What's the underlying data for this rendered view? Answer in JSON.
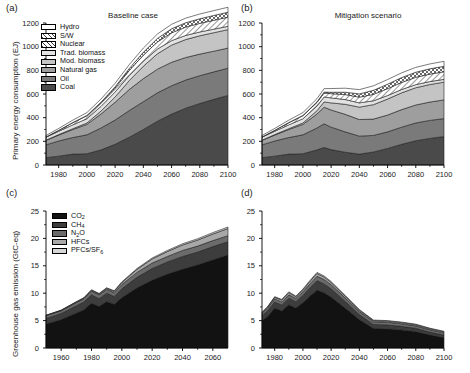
{
  "figure": {
    "panels": [
      {
        "tag": "(a)",
        "title": "Baseline case"
      },
      {
        "tag": "(b)",
        "title": "Mitigation scenario"
      },
      {
        "tag": "(c)",
        "title": ""
      },
      {
        "tag": "(d)",
        "title": ""
      }
    ]
  },
  "energy_legend": [
    {
      "label": "Hydro",
      "fill": "#ffffff",
      "pattern": "solid"
    },
    {
      "label": "S/W",
      "fill": "#ffffff",
      "pattern": "crosshatch"
    },
    {
      "label": "Nuclear",
      "fill": "#ffffff",
      "pattern": "diagonal"
    },
    {
      "label": "Trad. biomass",
      "fill": "#e2e2e2",
      "pattern": "solid"
    },
    {
      "label": "Mod. biomass",
      "fill": "#c4c4c4",
      "pattern": "solid"
    },
    {
      "label": "Natural gas",
      "fill": "#9e9e9e",
      "pattern": "solid"
    },
    {
      "label": "Oil",
      "fill": "#7a7a7a",
      "pattern": "solid"
    },
    {
      "label": "Coal",
      "fill": "#4a4a4a",
      "pattern": "solid"
    }
  ],
  "ghg_legend": [
    {
      "label": "CO2",
      "html": "CO<sub>2</sub>",
      "fill": "#121212",
      "pattern": "solid"
    },
    {
      "label": "CH4",
      "html": "CH<sub>4</sub>",
      "fill": "#3d3d3d",
      "pattern": "solid"
    },
    {
      "label": "N2O",
      "html": "N<sub>2</sub>O",
      "fill": "#6b6b6b",
      "pattern": "solid"
    },
    {
      "label": "HFCs",
      "html": "HFCs",
      "fill": "#a8a8a8",
      "pattern": "solid"
    },
    {
      "label": "PFCs/SF6",
      "html": "PFCs/SF<sub>6</sub>",
      "fill": "#d6d6d6",
      "pattern": "solid"
    }
  ],
  "chart_data": [
    {
      "id": "panel-a",
      "type": "area",
      "title": "Baseline case",
      "xlabel": "",
      "ylabel": "Primary energy consumption (EJ)",
      "xlim": [
        1971,
        2100
      ],
      "ylim": [
        0,
        1200
      ],
      "yticks": [
        0,
        200,
        400,
        600,
        800,
        1000,
        1200
      ],
      "xticks": [
        1980,
        2000,
        2020,
        2040,
        2060,
        2080,
        2100
      ],
      "grid": false,
      "legend_position": "upper-left",
      "stacked": true,
      "x": [
        1971,
        1980,
        1990,
        2000,
        2010,
        2020,
        2030,
        2040,
        2050,
        2060,
        2070,
        2080,
        2090,
        2100
      ],
      "series": [
        {
          "name": "Coal",
          "values": [
            62,
            75,
            92,
            95,
            128,
            175,
            235,
            300,
            370,
            430,
            480,
            520,
            555,
            588
          ]
        },
        {
          "name": "Oil",
          "values": [
            108,
            128,
            140,
            160,
            185,
            205,
            225,
            235,
            240,
            240,
            238,
            235,
            232,
            230
          ]
        },
        {
          "name": "Natural gas",
          "values": [
            38,
            50,
            68,
            88,
            118,
            150,
            178,
            195,
            200,
            198,
            190,
            182,
            175,
            170
          ]
        },
        {
          "name": "Mod. biomass",
          "values": [
            2,
            4,
            7,
            12,
            25,
            45,
            75,
            105,
            130,
            145,
            152,
            155,
            156,
            156
          ]
        },
        {
          "name": "Trad. biomass",
          "values": [
            25,
            28,
            32,
            36,
            40,
            42,
            43,
            42,
            40,
            38,
            35,
            32,
            30,
            28
          ]
        },
        {
          "name": "Nuclear",
          "values": [
            2,
            8,
            19,
            26,
            30,
            34,
            42,
            52,
            60,
            66,
            70,
            73,
            75,
            77
          ]
        },
        {
          "name": "S/W",
          "values": [
            0,
            0,
            1,
            2,
            5,
            10,
            17,
            24,
            30,
            34,
            37,
            39,
            41,
            42
          ]
        },
        {
          "name": "Hydro",
          "values": [
            12,
            16,
            20,
            24,
            27,
            30,
            33,
            35,
            37,
            38,
            39,
            40,
            41,
            42
          ]
        }
      ]
    },
    {
      "id": "panel-b",
      "type": "area",
      "title": "Mitigation scenario",
      "xlabel": "",
      "ylabel": "Primary energy consumption (EJ)",
      "xlim": [
        1971,
        2100
      ],
      "ylim": [
        0,
        1200
      ],
      "yticks": [
        0,
        200,
        400,
        600,
        800,
        1000,
        1200
      ],
      "xticks": [
        1980,
        2000,
        2020,
        2040,
        2060,
        2080,
        2100
      ],
      "grid": false,
      "stacked": true,
      "x": [
        1971,
        1980,
        1990,
        2000,
        2010,
        2015,
        2020,
        2030,
        2040,
        2050,
        2060,
        2070,
        2080,
        2090,
        2100
      ],
      "series": [
        {
          "name": "Coal",
          "values": [
            62,
            75,
            92,
            95,
            128,
            148,
            130,
            108,
            92,
            110,
            140,
            175,
            205,
            225,
            240
          ]
        },
        {
          "name": "Oil",
          "values": [
            108,
            128,
            140,
            160,
            185,
            200,
            190,
            172,
            152,
            140,
            140,
            145,
            150,
            152,
            152
          ]
        },
        {
          "name": "Natural gas",
          "values": [
            38,
            50,
            68,
            88,
            118,
            140,
            145,
            148,
            140,
            138,
            142,
            148,
            152,
            155,
            158
          ]
        },
        {
          "name": "Mod. biomass",
          "values": [
            2,
            4,
            7,
            12,
            28,
            45,
            60,
            85,
            105,
            122,
            135,
            142,
            146,
            148,
            150
          ]
        },
        {
          "name": "Trad. biomass",
          "values": [
            25,
            28,
            32,
            36,
            40,
            42,
            42,
            40,
            36,
            33,
            30,
            28,
            26,
            25,
            24
          ]
        },
        {
          "name": "Nuclear",
          "values": [
            2,
            8,
            19,
            26,
            30,
            33,
            36,
            42,
            48,
            54,
            58,
            60,
            62,
            63,
            64
          ]
        },
        {
          "name": "S/W",
          "values": [
            0,
            0,
            1,
            2,
            5,
            8,
            12,
            20,
            28,
            34,
            38,
            41,
            43,
            45,
            46
          ]
        },
        {
          "name": "Hydro",
          "values": [
            12,
            16,
            20,
            24,
            27,
            29,
            31,
            34,
            36,
            38,
            39,
            40,
            41,
            41,
            42
          ]
        }
      ]
    },
    {
      "id": "panel-c",
      "type": "area",
      "title": "",
      "xlabel": "",
      "ylabel": "Greenhouse gas emission (GtC-eq)",
      "xlim": [
        1950,
        2070
      ],
      "ylim": [
        0,
        25
      ],
      "yticks": [
        0,
        5,
        10,
        15,
        20,
        25
      ],
      "xticks": [
        1960,
        1980,
        2000,
        2020,
        2040,
        2060
      ],
      "grid": false,
      "legend_position": "upper-left",
      "stacked": true,
      "x": [
        1950,
        1960,
        1970,
        1975,
        1980,
        1985,
        1990,
        1995,
        2000,
        2010,
        2020,
        2030,
        2040,
        2050,
        2060,
        2070
      ],
      "series": [
        {
          "name": "CO2",
          "values": [
            4.4,
            5.2,
            6.4,
            7.0,
            8.2,
            7.6,
            8.5,
            8.0,
            9.2,
            11.0,
            12.4,
            13.5,
            14.4,
            15.2,
            16.1,
            17.0
          ]
        },
        {
          "name": "CH4",
          "values": [
            1.0,
            1.1,
            1.3,
            1.4,
            1.5,
            1.4,
            1.5,
            1.4,
            1.6,
            1.9,
            2.1,
            2.2,
            2.3,
            2.3,
            2.4,
            2.4
          ]
        },
        {
          "name": "N2O",
          "values": [
            0.5,
            0.5,
            0.6,
            0.6,
            0.7,
            0.7,
            0.7,
            0.7,
            0.8,
            0.9,
            1.0,
            1.0,
            1.1,
            1.1,
            1.1,
            1.1
          ]
        },
        {
          "name": "HFCs",
          "values": [
            0.05,
            0.07,
            0.1,
            0.12,
            0.15,
            0.18,
            0.2,
            0.25,
            0.35,
            0.55,
            0.75,
            0.9,
            1.0,
            1.1,
            1.2,
            1.3
          ]
        },
        {
          "name": "PFCs/SF6",
          "values": [
            0.03,
            0.04,
            0.05,
            0.06,
            0.07,
            0.08,
            0.09,
            0.1,
            0.12,
            0.15,
            0.18,
            0.2,
            0.22,
            0.24,
            0.26,
            0.28
          ]
        }
      ]
    },
    {
      "id": "panel-d",
      "type": "area",
      "title": "",
      "xlabel": "",
      "ylabel": "Greenhouse gas emission (GtC-eq)",
      "xlim": [
        1971,
        2100
      ],
      "ylim": [
        0,
        25
      ],
      "yticks": [
        0,
        5,
        10,
        15,
        20,
        25
      ],
      "xticks": [
        1980,
        2000,
        2020,
        2040,
        2060,
        2080,
        2100
      ],
      "grid": false,
      "stacked": true,
      "x": [
        1971,
        1975,
        1980,
        1985,
        1990,
        1995,
        2000,
        2005,
        2010,
        2015,
        2020,
        2030,
        2040,
        2050,
        2060,
        2070,
        2080,
        2090,
        2100
      ],
      "series": [
        {
          "name": "CO2",
          "values": [
            5.0,
            5.8,
            7.3,
            6.8,
            7.9,
            7.3,
            8.3,
            9.5,
            10.6,
            10.1,
            9.3,
            7.3,
            5.2,
            3.6,
            3.5,
            3.3,
            3.0,
            2.4,
            1.9
          ]
        },
        {
          "name": "CH4",
          "values": [
            0.9,
            1.0,
            1.1,
            1.05,
            1.2,
            1.15,
            1.3,
            1.5,
            1.7,
            1.6,
            1.5,
            1.2,
            0.9,
            0.7,
            0.7,
            0.65,
            0.6,
            0.5,
            0.45
          ]
        },
        {
          "name": "N2O",
          "values": [
            0.45,
            0.5,
            0.55,
            0.55,
            0.6,
            0.6,
            0.65,
            0.7,
            0.8,
            0.8,
            0.75,
            0.65,
            0.55,
            0.5,
            0.5,
            0.48,
            0.45,
            0.42,
            0.4
          ]
        },
        {
          "name": "HFCs",
          "values": [
            0.1,
            0.15,
            0.3,
            0.35,
            0.4,
            0.3,
            0.35,
            0.45,
            0.5,
            0.45,
            0.4,
            0.3,
            0.25,
            0.2,
            0.2,
            0.2,
            0.2,
            0.2,
            0.2
          ]
        },
        {
          "name": "PFCs/SF6",
          "values": [
            0.08,
            0.1,
            0.12,
            0.12,
            0.15,
            0.13,
            0.15,
            0.18,
            0.2,
            0.2,
            0.18,
            0.15,
            0.12,
            0.1,
            0.1,
            0.1,
            0.1,
            0.1,
            0.1
          ]
        }
      ]
    }
  ]
}
